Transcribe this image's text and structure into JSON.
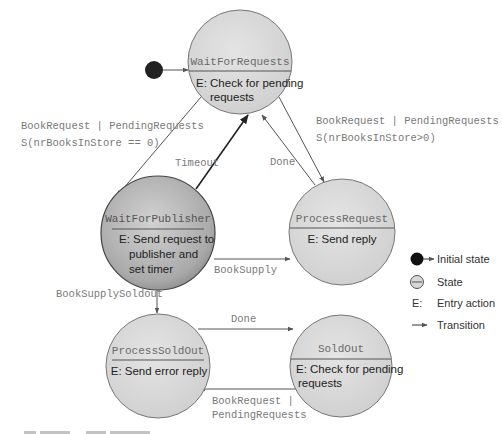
{
  "diagram": {
    "type": "state-machine",
    "initial_state": "WaitForRequests",
    "states": [
      {
        "id": "WaitForRequests",
        "name": "WaitForRequests",
        "entry_lines": [
          "E: Check for pending",
          "requests"
        ]
      },
      {
        "id": "WaitForPublisher",
        "name": "WaitForPublisher",
        "entry_lines": [
          "E: Send request to",
          "publisher and",
          "set timer"
        ]
      },
      {
        "id": "ProcessRequest",
        "name": "ProcessRequest",
        "entry_lines": [
          "E: Send reply"
        ]
      },
      {
        "id": "ProcessSoldOut",
        "name": "ProcessSoldOut",
        "entry_lines": [
          "E: Send error reply"
        ]
      },
      {
        "id": "SoldOut",
        "name": "SoldOut",
        "entry_lines": [
          "E: Check for pending",
          "requests"
        ]
      }
    ],
    "transitions": [
      {
        "from": "WaitForRequests",
        "to": "WaitForPublisher",
        "label_lines": [
          "BookRequest | PendingRequests",
          "S(nrBooksInStore == 0)"
        ]
      },
      {
        "from": "WaitForRequests",
        "to": "ProcessRequest",
        "label_lines": [
          "BookRequest | PendingRequests",
          "S(nrBooksInStore>0)"
        ]
      },
      {
        "from": "WaitForPublisher",
        "to": "WaitForRequests",
        "label_lines": [
          "Timeout"
        ]
      },
      {
        "from": "ProcessRequest",
        "to": "WaitForRequests",
        "label_lines": [
          "Done"
        ]
      },
      {
        "from": "WaitForPublisher",
        "to": "ProcessRequest",
        "label_lines": [
          "BookSupply"
        ]
      },
      {
        "from": "WaitForPublisher",
        "to": "ProcessSoldOut",
        "label_lines": [
          "BookSupplySoldout"
        ]
      },
      {
        "from": "ProcessSoldOut",
        "to": "SoldOut",
        "label_lines": [
          "Done"
        ]
      },
      {
        "from": "SoldOut",
        "to": "ProcessSoldOut",
        "label_lines": [
          "BookRequest |",
          "PendingRequests"
        ]
      }
    ],
    "legend": [
      {
        "icon": "initial-state-icon",
        "label": "Initial state"
      },
      {
        "icon": "state-icon",
        "label": "State"
      },
      {
        "icon": "entry-action-icon",
        "symbol": "E:",
        "label": "Entry action"
      },
      {
        "icon": "transition-arrow-icon",
        "label": "Transition"
      }
    ]
  }
}
